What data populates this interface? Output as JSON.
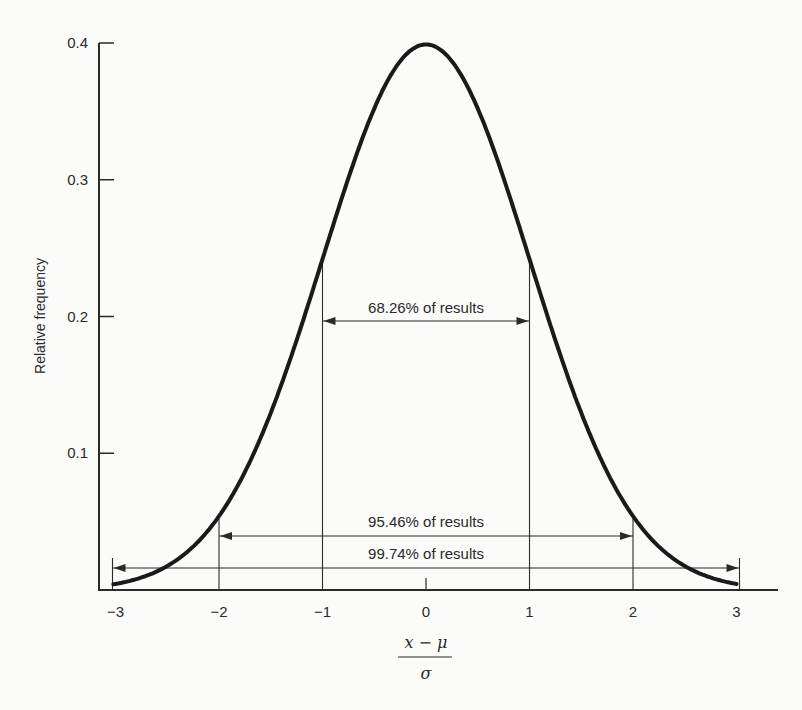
{
  "chart_data": {
    "type": "line",
    "title": "",
    "xlabel": "(x − μ) / σ",
    "xlabel_numerator": "x − μ",
    "xlabel_denominator": "σ",
    "ylabel": "Relative frequency",
    "xlim": [
      -3.1,
      3.4
    ],
    "ylim": [
      0,
      0.4
    ],
    "grid": false,
    "legend": null,
    "x_ticks": [
      -3,
      -2,
      -1,
      0,
      1,
      2,
      3
    ],
    "x_tick_labels": [
      "−3",
      "−2",
      "−1",
      "0",
      "1",
      "2",
      "3"
    ],
    "y_ticks": [
      0.1,
      0.2,
      0.3,
      0.4
    ],
    "y_tick_labels": [
      "0.1",
      "0.2",
      "0.3",
      "0.4"
    ],
    "series": [
      {
        "name": "Normal (Gaussian) distribution",
        "x": [
          -3,
          -2.5,
          -2,
          -1.5,
          -1,
          -0.5,
          0,
          0.5,
          1,
          1.5,
          2,
          2.5,
          3
        ],
        "values": [
          0.0044,
          0.0175,
          0.054,
          0.1295,
          0.242,
          0.352,
          0.3989,
          0.352,
          0.242,
          0.1295,
          0.054,
          0.0175,
          0.0044
        ]
      }
    ],
    "annotations": [
      {
        "label": "68.26% of results",
        "from": -1,
        "to": 1,
        "y": 0.2
      },
      {
        "label": "95.46% of results",
        "from": -2,
        "to": 2,
        "y": 0.04
      },
      {
        "label": "99.74% of results",
        "from": -3,
        "to": 3,
        "y": 0.016
      }
    ]
  }
}
